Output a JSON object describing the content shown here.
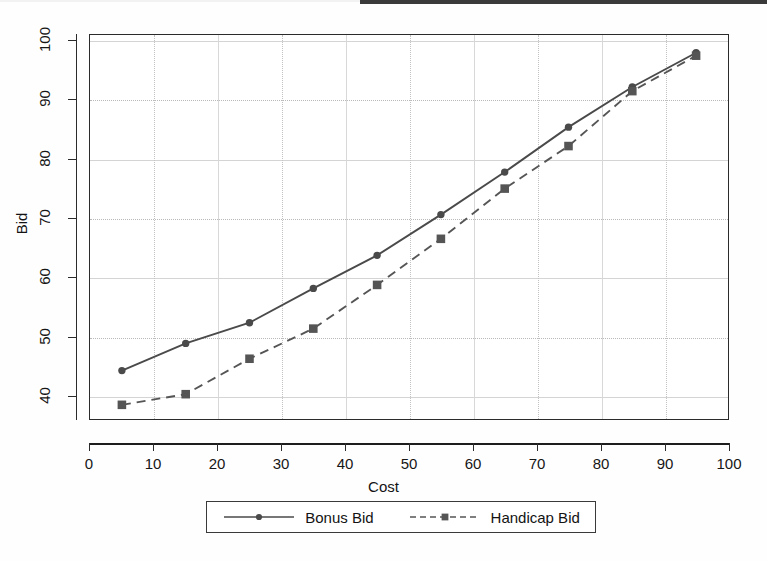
{
  "chart_data": {
    "type": "line",
    "title": "",
    "xlabel": "Cost",
    "ylabel": "Bid",
    "xlim": [
      0,
      100
    ],
    "ylim": [
      36,
      101
    ],
    "x_ticks": [
      0,
      10,
      20,
      30,
      40,
      50,
      60,
      70,
      80,
      90,
      100
    ],
    "y_ticks": [
      40,
      50,
      60,
      70,
      80,
      90,
      100
    ],
    "grid": true,
    "legend_position": "below-center",
    "x": [
      5,
      15,
      25,
      35,
      45,
      55,
      65,
      75,
      85,
      95
    ],
    "series": [
      {
        "name": "Bonus Bid",
        "style": "solid",
        "marker": "circle",
        "color": "#4a4a4a",
        "values": [
          44.2,
          48.8,
          52.3,
          58.1,
          63.7,
          70.6,
          77.8,
          85.4,
          92.2,
          98.0
        ]
      },
      {
        "name": "Handicap Bid",
        "style": "dashed",
        "marker": "square",
        "color": "#555555",
        "values": [
          38.4,
          40.2,
          46.2,
          51.3,
          58.7,
          66.5,
          75.0,
          82.2,
          91.5,
          97.5
        ]
      }
    ]
  },
  "axes": {
    "x_title": "Cost",
    "y_title": "Bid",
    "x_tick_labels": [
      "0",
      "10",
      "20",
      "30",
      "40",
      "50",
      "60",
      "70",
      "80",
      "90",
      "100"
    ],
    "y_tick_labels": [
      "40",
      "50",
      "60",
      "70",
      "80",
      "90",
      "100"
    ]
  },
  "legend": {
    "entries": [
      {
        "label": "Bonus Bid"
      },
      {
        "label": "Handicap Bid"
      }
    ]
  }
}
